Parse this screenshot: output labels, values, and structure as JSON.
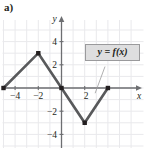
{
  "part_label": "a)",
  "legend": {
    "text": "y = f(x)",
    "box_color": "#dededf",
    "border_color": "#9a9a9c"
  },
  "axes": {
    "x_name": "x",
    "y_name": "y",
    "x_ticks": [
      {
        "value": -4,
        "label": "−4"
      },
      {
        "value": -2,
        "label": "−2"
      },
      {
        "value": 2,
        "label": "2"
      }
    ],
    "y_ticks": [
      {
        "value": 4,
        "label": "4"
      },
      {
        "value": 2,
        "label": "2"
      },
      {
        "value": -2,
        "label": "−2"
      },
      {
        "value": -4,
        "label": "−4"
      }
    ],
    "xlim": [
      -6,
      5
    ],
    "ylim": [
      -5,
      5
    ],
    "grid": true,
    "grid_color": "#e9e9ec",
    "axis_color": "#6d6e71"
  },
  "chart_data": {
    "type": "line",
    "title": "",
    "subtitle": "",
    "xlabel": "x",
    "ylabel": "y",
    "xlim": [
      -6,
      5
    ],
    "ylim": [
      -5,
      5
    ],
    "grid": true,
    "legend_position": "upper-right",
    "annotations": [
      {
        "text": "y = f(x)",
        "x": 2.2,
        "y": 3.0,
        "leader_to_x": 2.9,
        "leader_to_y": -0.45
      }
    ],
    "series": [
      {
        "name": "f(x)",
        "color": "#58595b",
        "points": [
          {
            "x": -5,
            "y": 0
          },
          {
            "x": -2,
            "y": 3
          },
          {
            "x": 0,
            "y": 0
          },
          {
            "x": 2,
            "y": -3
          },
          {
            "x": 4,
            "y": 0
          }
        ],
        "markers": [
          {
            "x": -5,
            "y": 0
          },
          {
            "x": -2,
            "y": 3
          },
          {
            "x": 0,
            "y": 0
          },
          {
            "x": 2,
            "y": -3
          },
          {
            "x": 4,
            "y": 0
          }
        ]
      }
    ]
  }
}
